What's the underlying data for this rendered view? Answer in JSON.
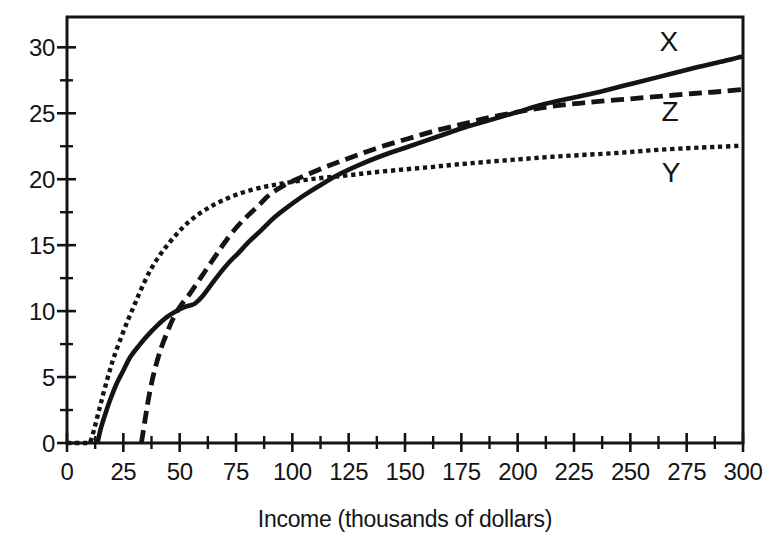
{
  "figure": {
    "background": "#ffffff",
    "ink_color": "#141414"
  },
  "chart_data": {
    "type": "line",
    "title": "",
    "xlabel": "Income (thousands of dollars)",
    "ylabel": "",
    "xlim": [
      0,
      300
    ],
    "ylim": [
      0,
      32.3
    ],
    "x_major_ticks": [
      0,
      25,
      50,
      75,
      100,
      125,
      150,
      175,
      200,
      225,
      250,
      275,
      300
    ],
    "x_minor_step": 12.5,
    "y_major_ticks": [
      0,
      5,
      10,
      15,
      20,
      25,
      30
    ],
    "y_minor_step": 2.5,
    "grid": false,
    "frame": "full-box",
    "legend_position": "labels-at-line-ends-right",
    "series": [
      {
        "name": "Y",
        "label": "Y",
        "line_style": "dotted",
        "color": "#141414",
        "label_anchor": [
          268,
          20.5
        ],
        "points": [
          [
            0,
            0
          ],
          [
            9,
            0
          ],
          [
            10.5,
            0.15
          ],
          [
            12,
            1.0
          ],
          [
            13.5,
            2.0
          ],
          [
            15,
            3.0
          ],
          [
            17,
            4.3
          ],
          [
            19,
            5.5
          ],
          [
            21,
            6.6
          ],
          [
            24,
            8.0
          ],
          [
            27,
            9.3
          ],
          [
            30,
            10.5
          ],
          [
            33,
            11.7
          ],
          [
            37,
            13.1
          ],
          [
            41,
            14.2
          ],
          [
            45,
            15.1
          ],
          [
            49,
            15.9
          ],
          [
            53,
            16.6
          ],
          [
            58,
            17.3
          ],
          [
            63,
            17.85
          ],
          [
            68,
            18.3
          ],
          [
            74,
            18.75
          ],
          [
            80,
            19.1
          ],
          [
            87,
            19.4
          ],
          [
            93,
            19.6
          ],
          [
            100,
            19.8
          ],
          [
            108,
            20.0
          ],
          [
            116,
            20.15
          ],
          [
            125,
            20.3
          ],
          [
            135,
            20.5
          ],
          [
            147,
            20.7
          ],
          [
            160,
            20.9
          ],
          [
            172,
            21.1
          ],
          [
            185,
            21.3
          ],
          [
            200,
            21.5
          ],
          [
            215,
            21.7
          ],
          [
            230,
            21.85
          ],
          [
            245,
            22.0
          ],
          [
            260,
            22.2
          ],
          [
            275,
            22.35
          ],
          [
            288,
            22.45
          ],
          [
            300,
            22.55
          ]
        ]
      },
      {
        "name": "Z",
        "label": "Z",
        "line_style": "dashed",
        "color": "#141414",
        "label_anchor": [
          267.5,
          25.1
        ],
        "points": [
          [
            33,
            0
          ],
          [
            34.5,
            1.6
          ],
          [
            36,
            3.2
          ],
          [
            38,
            4.9
          ],
          [
            40,
            6.2
          ],
          [
            42,
            7.3
          ],
          [
            44.5,
            8.4
          ],
          [
            47,
            9.4
          ],
          [
            50,
            10.3
          ],
          [
            54,
            11.2
          ],
          [
            58,
            12.2
          ],
          [
            62,
            13.2
          ],
          [
            66,
            14.2
          ],
          [
            70,
            15.2
          ],
          [
            75,
            16.3
          ],
          [
            80,
            17.2
          ],
          [
            85,
            18.0
          ],
          [
            90,
            18.85
          ],
          [
            96,
            19.5
          ],
          [
            102,
            20.0
          ],
          [
            108,
            20.45
          ],
          [
            115,
            20.95
          ],
          [
            122,
            21.4
          ],
          [
            130,
            21.9
          ],
          [
            140,
            22.5
          ],
          [
            152,
            23.1
          ],
          [
            164,
            23.7
          ],
          [
            176,
            24.2
          ],
          [
            188,
            24.7
          ],
          [
            200,
            25.1
          ],
          [
            212,
            25.45
          ],
          [
            224,
            25.7
          ],
          [
            236,
            25.9
          ],
          [
            250,
            26.1
          ],
          [
            264,
            26.3
          ],
          [
            278,
            26.5
          ],
          [
            290,
            26.65
          ],
          [
            300,
            26.8
          ]
        ]
      },
      {
        "name": "X",
        "label": "X",
        "line_style": "solid",
        "color": "#141414",
        "label_anchor": [
          267,
          30.4
        ],
        "points": [
          [
            13.5,
            0
          ],
          [
            15,
            1.1
          ],
          [
            17,
            2.2
          ],
          [
            19,
            3.2
          ],
          [
            22,
            4.5
          ],
          [
            25,
            5.5
          ],
          [
            28,
            6.5
          ],
          [
            32,
            7.4
          ],
          [
            36,
            8.2
          ],
          [
            40,
            8.9
          ],
          [
            44,
            9.5
          ],
          [
            48,
            9.95
          ],
          [
            52,
            10.3
          ],
          [
            55,
            10.45
          ],
          [
            57,
            10.6
          ],
          [
            60,
            11.1
          ],
          [
            64,
            12.0
          ],
          [
            68,
            12.9
          ],
          [
            72,
            13.7
          ],
          [
            76,
            14.4
          ],
          [
            81,
            15.3
          ],
          [
            86,
            16.1
          ],
          [
            92,
            17.1
          ],
          [
            98,
            17.9
          ],
          [
            105,
            18.75
          ],
          [
            112,
            19.5
          ],
          [
            120,
            20.3
          ],
          [
            130,
            21.1
          ],
          [
            140,
            21.8
          ],
          [
            152,
            22.5
          ],
          [
            164,
            23.2
          ],
          [
            176,
            23.9
          ],
          [
            188,
            24.5
          ],
          [
            200,
            25.1
          ],
          [
            212,
            25.7
          ],
          [
            225,
            26.2
          ],
          [
            238,
            26.7
          ],
          [
            252,
            27.3
          ],
          [
            266,
            27.9
          ],
          [
            280,
            28.5
          ],
          [
            290,
            28.9
          ],
          [
            300,
            29.3
          ]
        ]
      }
    ]
  }
}
